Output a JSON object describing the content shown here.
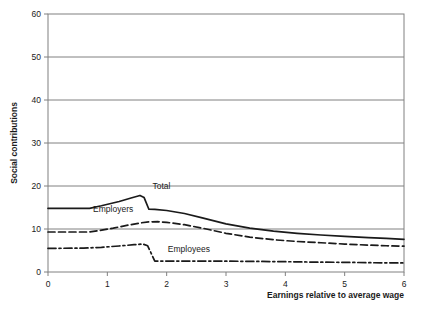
{
  "chart_data": {
    "type": "line",
    "title": "",
    "xlabel": "Earnings relative to average wage",
    "ylabel": "Social contributions",
    "xlim": [
      0,
      6
    ],
    "ylim": [
      0,
      60
    ],
    "xticks": [
      "0",
      "1",
      "2",
      "3",
      "4",
      "5",
      "6"
    ],
    "yticks": [
      "0",
      "10",
      "20",
      "30",
      "40",
      "50",
      "60"
    ],
    "grid": "horizontal",
    "legend_position": "inline-annotations",
    "series": [
      {
        "name": "Total",
        "style": "solid",
        "color": "#1a1a1a",
        "label_x": 1.76,
        "label_y": 19.2,
        "x": [
          0.0,
          0.7,
          0.9,
          1.2,
          1.4,
          1.55,
          1.62,
          1.7,
          1.8,
          2.0,
          2.3,
          2.6,
          3.0,
          3.4,
          3.8,
          4.2,
          4.6,
          5.0,
          5.4,
          5.7,
          6.0
        ],
        "y": [
          14.8,
          14.8,
          15.4,
          16.4,
          17.2,
          17.8,
          17.3,
          14.6,
          14.55,
          14.3,
          13.6,
          12.6,
          11.2,
          10.2,
          9.5,
          9.0,
          8.6,
          8.3,
          8.0,
          7.8,
          7.6
        ]
      },
      {
        "name": "Employers",
        "style": "dashed",
        "color": "#1a1a1a",
        "label_x": 0.76,
        "label_y": 13.9,
        "x": [
          0.0,
          0.7,
          0.85,
          1.1,
          1.35,
          1.55,
          1.7,
          1.85,
          2.0,
          2.3,
          2.6,
          3.0,
          3.4,
          3.8,
          4.2,
          4.6,
          5.0,
          5.4,
          5.7,
          6.0
        ],
        "y": [
          9.3,
          9.3,
          9.6,
          10.2,
          10.9,
          11.4,
          11.65,
          11.7,
          11.55,
          11.0,
          10.2,
          9.0,
          8.1,
          7.5,
          7.1,
          6.8,
          6.5,
          6.25,
          6.1,
          6.0
        ]
      },
      {
        "name": "Employees",
        "style": "dashdot",
        "color": "#1a1a1a",
        "label_x": 2.02,
        "label_y": 4.6,
        "x": [
          0.0,
          0.6,
          0.9,
          1.2,
          1.45,
          1.6,
          1.68,
          1.8,
          2.0,
          2.4,
          2.8,
          3.2,
          3.6,
          4.0,
          4.5,
          5.0,
          5.5,
          6.0
        ],
        "y": [
          5.5,
          5.55,
          5.75,
          6.05,
          6.35,
          6.5,
          6.1,
          2.55,
          2.55,
          2.55,
          2.55,
          2.5,
          2.45,
          2.4,
          2.3,
          2.25,
          2.15,
          2.1
        ]
      }
    ]
  },
  "colors": {
    "line": "#1a1a1a",
    "grid": "#808080",
    "frame": "#808080",
    "text": "#1a1a1a",
    "background": "#ffffff"
  }
}
